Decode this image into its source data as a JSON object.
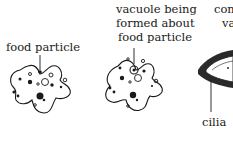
{
  "diagram": {
    "type": "biology-sequence",
    "panels": [
      {
        "id": "panel-1",
        "label": "food particle"
      },
      {
        "id": "panel-2",
        "label_lines": [
          "vacuole being",
          "formed about",
          "food particle"
        ]
      },
      {
        "id": "panel-3",
        "label_lines": [
          "com",
          "va"
        ],
        "callout": "cilia"
      }
    ]
  }
}
